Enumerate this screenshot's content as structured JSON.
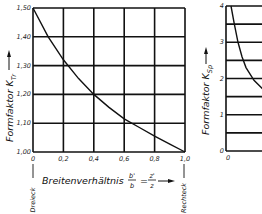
{
  "chart_data": [
    {
      "type": "line",
      "title": "",
      "xlabel": "Breitenverhältnis b'/b = z'/z",
      "xlabel_parts": {
        "prefix": "Breitenverhältnis",
        "frac1_num": "b'",
        "frac1_den": "b",
        "eq": "=",
        "frac2_num": "z'",
        "frac2_den": "z"
      },
      "ylabel": "Formfaktor K_Tr",
      "ylabel_main": "Formfaktor K",
      "ylabel_sub": "Tr",
      "x_left_note": "Dreieck",
      "x_right_note": "Rechteck",
      "xlim": [
        0,
        1.0
      ],
      "ylim": [
        1.0,
        1.5
      ],
      "grid": true,
      "x_ticks": [
        "0",
        "0,2",
        "0,4",
        "0,6",
        "0,8",
        "1,0"
      ],
      "y_ticks": [
        "1,00",
        "1,10",
        "1,20",
        "1,30",
        "1,40",
        "1,50"
      ],
      "x": [
        0,
        0.1,
        0.2,
        0.3,
        0.4,
        0.5,
        0.6,
        0.7,
        0.8,
        0.9,
        1.0
      ],
      "values": [
        1.5,
        1.4,
        1.32,
        1.255,
        1.2,
        1.155,
        1.115,
        1.085,
        1.055,
        1.027,
        1.0
      ]
    },
    {
      "type": "line",
      "title": "",
      "xlabel": "",
      "ylabel": "Formfaktor K_Sp",
      "ylabel_main": "Formfaktor K",
      "ylabel_sub": "Sp",
      "xlim": [
        0,
        2
      ],
      "ylim": [
        0,
        4
      ],
      "grid": true,
      "x_ticks": [
        "0",
        "2"
      ],
      "y_ticks": [
        "0",
        "1",
        "2",
        "3",
        "4"
      ],
      "x": [
        0.25,
        0.4,
        0.6,
        0.8,
        1.0,
        1.4,
        2.0,
        2.6
      ],
      "values": [
        4.0,
        3.55,
        3.0,
        2.6,
        2.3,
        1.95,
        1.62,
        1.4
      ],
      "note": "chart truncated at right edge of image"
    }
  ]
}
